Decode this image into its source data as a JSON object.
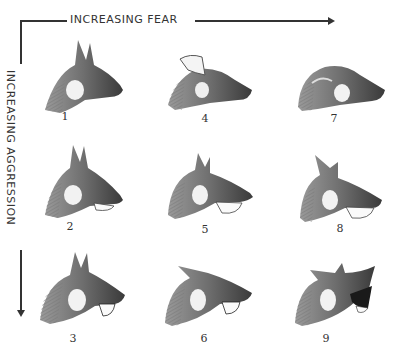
{
  "axes": {
    "horizontal": {
      "label": "INCREASING FEAR",
      "direction": "right"
    },
    "vertical": {
      "label": "INCREASING AGGRESSION",
      "direction": "down"
    }
  },
  "grid": {
    "rows": 3,
    "columns": 3,
    "cells": [
      {
        "number": "1",
        "row": 1,
        "col": 1,
        "ears": "erect",
        "mouth": "closed"
      },
      {
        "number": "4",
        "row": 1,
        "col": 2,
        "ears": "back",
        "mouth": "closed"
      },
      {
        "number": "7",
        "row": 1,
        "col": 3,
        "ears": "flat",
        "mouth": "closed"
      },
      {
        "number": "2",
        "row": 2,
        "col": 1,
        "ears": "erect",
        "mouth": "slightly open"
      },
      {
        "number": "5",
        "row": 2,
        "col": 2,
        "ears": "partly back",
        "mouth": "open"
      },
      {
        "number": "8",
        "row": 2,
        "col": 3,
        "ears": "back",
        "mouth": "open"
      },
      {
        "number": "3",
        "row": 3,
        "col": 1,
        "ears": "erect",
        "mouth": "snarling"
      },
      {
        "number": "6",
        "row": 3,
        "col": 2,
        "ears": "back",
        "mouth": "snarling"
      },
      {
        "number": "9",
        "row": 3,
        "col": 3,
        "ears": "flat",
        "mouth": "wide snarl"
      }
    ]
  }
}
